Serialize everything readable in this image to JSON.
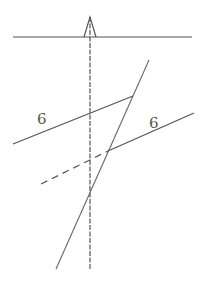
{
  "diagram": {
    "colors": {
      "stroke": "#555555",
      "background": "#ffffff"
    },
    "labels": [
      {
        "text": "6",
        "x": 37,
        "y": 124
      },
      {
        "text": "6",
        "x": 149,
        "y": 128
      }
    ],
    "elements": {
      "ground_line": {
        "x1": 13,
        "y1": 37,
        "x2": 192,
        "y2": 37
      },
      "vertical_axis": {
        "x1": 90,
        "y1": 17,
        "x2": 90,
        "y2": 270,
        "style": "dashed"
      },
      "marker_triangle": {
        "apex": [
          90,
          17
        ],
        "base_left": [
          84,
          37
        ],
        "base_right": [
          96,
          37
        ]
      },
      "steep_line": {
        "x1": 149,
        "y1": 60,
        "x2": 56,
        "y2": 269
      },
      "upper_line": {
        "x1": 13,
        "y1": 144,
        "x2": 133,
        "y2": 96
      },
      "lower_line": {
        "x1": 108,
        "y1": 151,
        "x2": 194,
        "y2": 113
      },
      "lower_line_dashed_extension": {
        "x1": 41,
        "y1": 184,
        "x2": 108,
        "y2": 151,
        "style": "dashed"
      }
    }
  }
}
